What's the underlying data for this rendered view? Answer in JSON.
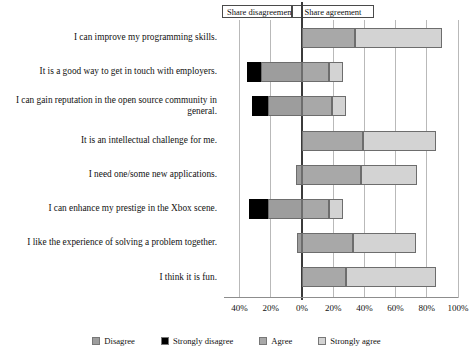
{
  "annotations": {
    "disagreement_label": "Share disagreement",
    "agreement_label": "Share agreement"
  },
  "legend": {
    "items": [
      {
        "label": "Disagree",
        "color": "#9d9d9d"
      },
      {
        "label": "Strongly disagree",
        "color": "#000000"
      },
      {
        "label": "Agree",
        "color": "#a8a8a8"
      },
      {
        "label": "Strongly agree",
        "color": "#d3d3d3"
      }
    ]
  },
  "chart_data": {
    "type": "bar",
    "title": "",
    "subtitle": "",
    "xlabel": "",
    "ylabel": "",
    "orientation": "horizontal",
    "stacked": true,
    "diverging": true,
    "grid": true,
    "legend_position": "bottom",
    "xlim": [
      -50,
      100
    ],
    "xticks": [
      -40,
      -20,
      0,
      20,
      40,
      60,
      80,
      100
    ],
    "xtick_labels": [
      "40%",
      "20%",
      "0%",
      "20%",
      "40%",
      "60%",
      "80%",
      "100%"
    ],
    "categories": [
      "I can improve my programming skills.",
      "It is a good way to get in touch with employers.",
      "I can gain reputation in the open source community in general.",
      "It is an intellectual challenge for me.",
      "I need one/some new applications.",
      "I can enhance my prestige in the Xbox scene.",
      "I like the experience of solving a problem together.",
      "I think it is fun."
    ],
    "series": [
      {
        "name": "Strongly disagree",
        "color": "#000000",
        "side": "negative",
        "values": [
          0,
          9,
          10,
          0,
          0,
          12,
          0,
          0
        ]
      },
      {
        "name": "Disagree",
        "color": "#9d9d9d",
        "side": "negative",
        "values": [
          0,
          26,
          22,
          0,
          4,
          22,
          3,
          0
        ]
      },
      {
        "name": "Agree",
        "color": "#a8a8a8",
        "side": "positive",
        "values": [
          34,
          17,
          19,
          39,
          38,
          17,
          33,
          28
        ]
      },
      {
        "name": "Strongly agree",
        "color": "#d3d3d3",
        "side": "positive",
        "values": [
          56,
          9,
          9,
          47,
          36,
          9,
          40,
          58
        ]
      }
    ]
  }
}
